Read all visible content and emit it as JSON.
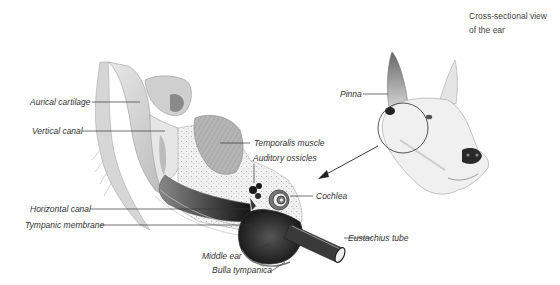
{
  "caption": {
    "line1": "Cross-sectional view",
    "line2": "of the ear"
  },
  "labels": {
    "aurical_cartilage": "Aurical cartilage",
    "vertical_canal": "Vertical canal",
    "temporalis_muscle": "Temporalis muscle",
    "auditory_ossicles": "Auditory ossicles",
    "cochlea": "Cochlea",
    "horizontal_canal": "Horizontal canal",
    "tympanic_membrane": "Tympanic membrane",
    "eustachius_tube": "Eustachius tube",
    "middle_ear": "Middle ear",
    "bulla_tympanica": "Bulla tympanica",
    "pinna": "Pinna"
  },
  "colors": {
    "line": "#333333",
    "text": "#333333",
    "dark_fill": "#1e1e1e",
    "mid_fill": "#9a9a9a",
    "light_fill": "#d8d8d8"
  }
}
